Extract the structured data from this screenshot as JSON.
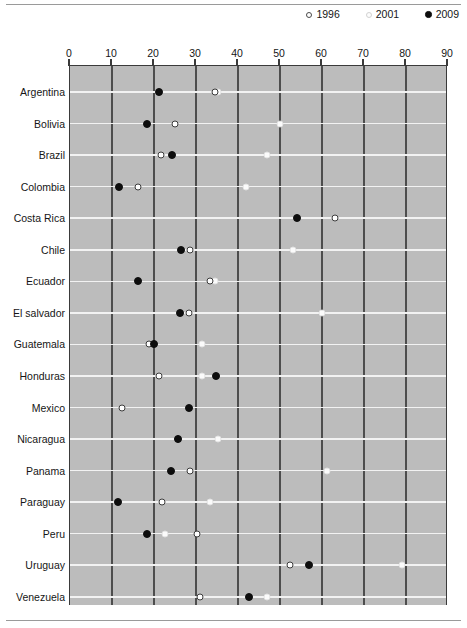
{
  "legend": {
    "position": "top-right",
    "items": [
      {
        "label": "1996",
        "marker": "open-circle-dark-outline",
        "color": "#ffffff"
      },
      {
        "label": "2001",
        "marker": "open-circle-light-outline",
        "color": "#fbfbfb"
      },
      {
        "label": "2009",
        "marker": "filled-circle",
        "color": "#0d0d0d"
      }
    ]
  },
  "axis": {
    "ticks": [
      "0",
      "10",
      "20",
      "30",
      "40",
      "50",
      "60",
      "70",
      "80",
      "90"
    ]
  },
  "chart_data": {
    "type": "scatter",
    "title": "",
    "xlabel": "",
    "ylabel": "",
    "xlim": [
      0,
      90
    ],
    "xticks": [
      0,
      10,
      20,
      30,
      40,
      50,
      60,
      70,
      80,
      90
    ],
    "grid": true,
    "orientation": "horizontal-dot-plot",
    "categories": [
      "Argentina",
      "Bolivia",
      "Brazil",
      "Colombia",
      "Costa Rica",
      "Chile",
      "Ecuador",
      "El salvador",
      "Guatemala",
      "Honduras",
      "Mexico",
      "Nicaragua",
      "Panama",
      "Paraguay",
      "Peru",
      "Uruguay",
      "Venezuela"
    ],
    "series": [
      {
        "name": "1996",
        "marker": "open-circle-dark-outline",
        "values": [
          34.5,
          25.0,
          21.7,
          16.2,
          63.0,
          28.6,
          33.3,
          28.3,
          18.7,
          21.2,
          12.4,
          25.7,
          28.6,
          21.9,
          30.2,
          52.4,
          31.0
        ]
      },
      {
        "name": "2001",
        "marker": "open-circle-light-outline",
        "values": [
          35.2,
          50.0,
          47.0,
          42.0,
          null,
          53.0,
          34.5,
          60.0,
          31.5,
          31.4,
          28.3,
          35.2,
          61.2,
          33.3,
          22.6,
          79.0,
          47.0
        ]
      },
      {
        "name": "2009",
        "marker": "filled-circle",
        "values": [
          21.2,
          18.3,
          24.3,
          11.7,
          54.0,
          26.4,
          16.2,
          26.2,
          20.0,
          34.8,
          28.3,
          25.7,
          24.0,
          11.4,
          18.3,
          56.9,
          42.6
        ]
      }
    ]
  }
}
